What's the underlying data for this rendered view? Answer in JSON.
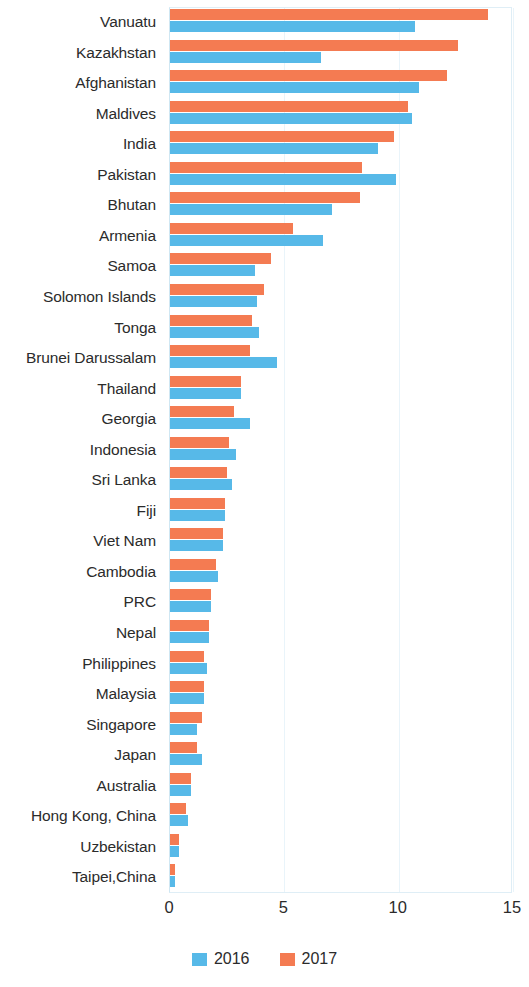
{
  "chart_data": {
    "type": "bar",
    "orientation": "horizontal",
    "title": "",
    "subtitle": "",
    "xlabel": "",
    "ylabel": "",
    "xlim": [
      0,
      15
    ],
    "xticks": [
      "0",
      "5",
      "10",
      "15"
    ],
    "xtick_values": [
      0,
      5,
      10,
      15
    ],
    "grid": true,
    "legend_position": "bottom",
    "categories": [
      "Vanuatu",
      "Kazakhstan",
      "Afghanistan",
      "Maldives",
      "India",
      "Pakistan",
      "Bhutan",
      "Armenia",
      "Samoa",
      "Solomon Islands",
      "Tonga",
      "Brunei Darussalam",
      "Thailand",
      "Georgia",
      "Indonesia",
      "Sri Lanka",
      "Fiji",
      "Viet Nam",
      "Cambodia",
      "PRC",
      "Nepal",
      "Philippines",
      "Malaysia",
      "Singapore",
      "Japan",
      "Australia",
      "Hong Kong, China",
      "Uzbekistan",
      "Taipei,China"
    ],
    "series": [
      {
        "name": "2016",
        "color": "#57b9e8",
        "values": [
          10.7,
          6.6,
          10.9,
          10.6,
          9.1,
          9.9,
          7.1,
          6.7,
          3.7,
          3.8,
          3.9,
          4.7,
          3.1,
          3.5,
          2.9,
          2.7,
          2.4,
          2.3,
          2.1,
          1.8,
          1.7,
          1.6,
          1.5,
          1.2,
          1.4,
          0.9,
          0.8,
          0.4,
          0.2
        ]
      },
      {
        "name": "2017",
        "color": "#f47b52",
        "values": [
          13.9,
          12.6,
          12.1,
          10.4,
          9.8,
          8.4,
          8.3,
          5.4,
          4.4,
          4.1,
          3.6,
          3.5,
          3.1,
          2.8,
          2.6,
          2.5,
          2.4,
          2.3,
          2.0,
          1.8,
          1.7,
          1.5,
          1.5,
          1.4,
          1.2,
          0.9,
          0.7,
          0.4,
          0.2
        ]
      }
    ]
  },
  "legend": {
    "items": [
      {
        "label": "2016",
        "color": "#57b9e8"
      },
      {
        "label": "2017",
        "color": "#f47b52"
      }
    ]
  },
  "colors": {
    "series_2016": "#57b9e8",
    "series_2017": "#f47b52",
    "plot_border": "#dfeef6",
    "gridline": "#e9f4fa",
    "text": "#2b2b2b",
    "background": "#ffffff"
  }
}
